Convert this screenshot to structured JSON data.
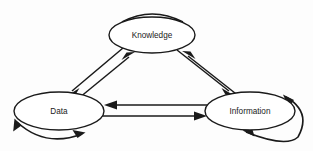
{
  "diagram": {
    "background_color": "#fdfdfd",
    "line_color": "#1a1a1a",
    "nodes": [
      {
        "id": "knowledge",
        "label": "Knowledge",
        "cx": 152,
        "cy": 35,
        "rx": 43,
        "ry": 18
      },
      {
        "id": "data",
        "label": "Data",
        "cx": 59,
        "cy": 111,
        "rx": 45,
        "ry": 19
      },
      {
        "id": "information",
        "label": "Information",
        "cx": 250,
        "cy": 111,
        "rx": 45,
        "ry": 19
      }
    ],
    "edges": [
      {
        "id": "knowledge-to-data",
        "from": "knowledge",
        "to": "data",
        "direction": "one-way",
        "style": "straight"
      },
      {
        "id": "data-to-knowledge",
        "from": "data",
        "to": "knowledge",
        "direction": "one-way",
        "style": "straight"
      },
      {
        "id": "knowledge-to-information",
        "from": "knowledge",
        "to": "information",
        "direction": "one-way",
        "style": "straight"
      },
      {
        "id": "information-to-knowledge",
        "from": "information",
        "to": "knowledge",
        "direction": "one-way",
        "style": "straight"
      },
      {
        "id": "information-to-data",
        "from": "information",
        "to": "data",
        "direction": "one-way",
        "style": "straight"
      },
      {
        "id": "data-to-information",
        "from": "data",
        "to": "information",
        "direction": "one-way",
        "style": "straight"
      }
    ],
    "self_loops": [
      {
        "id": "knowledge-self-loop",
        "node": "knowledge",
        "position": "top",
        "direction": "bidirectional"
      },
      {
        "id": "data-self-loop",
        "node": "data",
        "position": "bottom",
        "direction": "bidirectional"
      },
      {
        "id": "information-self-loop",
        "node": "information",
        "position": "right",
        "direction": "bidirectional"
      }
    ]
  }
}
